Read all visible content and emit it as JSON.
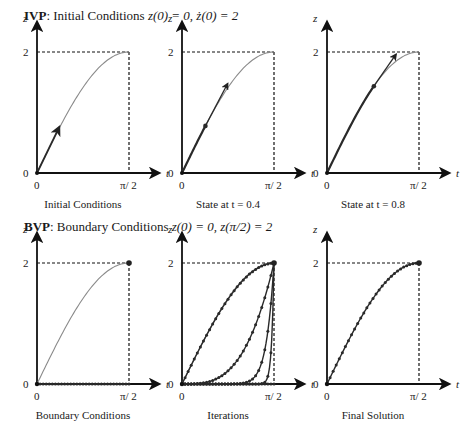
{
  "ivp": {
    "title_bold": "IVP",
    "title_rest": ": Initial Conditions ",
    "title_math": "z(0) = 0, ż(0) = 2",
    "panels": [
      {
        "caption": "Initial Conditions"
      },
      {
        "caption": "State at t = 0.4"
      },
      {
        "caption": "State at t = 0.8"
      }
    ]
  },
  "bvp": {
    "title_bold": "BVP",
    "title_rest": ": Boundary Conditions ",
    "title_math": "z(0) = 0, z(π/2) = 2",
    "panels": [
      {
        "caption": "Boundary Conditions"
      },
      {
        "caption": "Iterations"
      },
      {
        "caption": "Final Solution"
      }
    ]
  },
  "axes": {
    "y_label": "z",
    "x_label": "t",
    "y_tick_top": "2",
    "y_tick_bottom": "0",
    "x_tick_left": "0",
    "x_tick_right": "π/ 2"
  },
  "colors": {
    "axis": "#111111",
    "true_curve": "#8a8a8a",
    "trajectory": "#2a2a2a"
  },
  "chart_data": {
    "type": "line",
    "xlabel": "t",
    "ylabel": "z",
    "xlim": [
      0,
      1.5708
    ],
    "ylim": [
      0,
      2
    ],
    "x_ticks": [
      "0",
      "π/2"
    ],
    "y_ticks": [
      "0",
      "2"
    ],
    "grid": false,
    "panels": [
      {
        "name": "Initial Conditions",
        "true_curve": "z = 2 sin t",
        "arrow_from": [
          0,
          0
        ],
        "arrow_slope": 2
      },
      {
        "name": "State at t = 0.4",
        "point": [
          0.4,
          0.78
        ],
        "arrow_slope_at_point": 1.84
      },
      {
        "name": "State at t = 0.8",
        "point": [
          0.8,
          1.43
        ],
        "arrow_slope_at_point": 1.39
      },
      {
        "name": "Boundary Conditions",
        "initial_guess": "z = 0",
        "endpoints": [
          [
            0,
            0
          ],
          [
            1.5708,
            2
          ]
        ]
      },
      {
        "name": "Iterations",
        "series": [
          "steep near π/2 (iter 1)",
          "iter 2",
          "iter 3",
          "near solution (iter 4)"
        ]
      },
      {
        "name": "Final Solution",
        "curve": "z = 2 sin t"
      }
    ]
  }
}
